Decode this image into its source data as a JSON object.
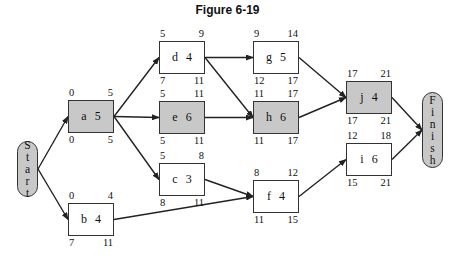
{
  "title": "Figure 6-19",
  "start": {
    "label": [
      "S",
      "t",
      "a",
      "r",
      "t"
    ]
  },
  "finish": {
    "label": [
      "F",
      "i",
      "n",
      "i",
      "s",
      "h"
    ]
  },
  "colors": {
    "critical": "#c8c8c8",
    "normal": "#ffffff",
    "line": "#222222"
  },
  "nodes": [
    {
      "id": "a",
      "dur": "5",
      "es": "0",
      "ef": "5",
      "ls": "0",
      "lf": "5",
      "critical": true,
      "x": 68,
      "y": 100
    },
    {
      "id": "b",
      "dur": "4",
      "es": "0",
      "ef": "4",
      "ls": "7",
      "lf": "11",
      "critical": false,
      "x": 68,
      "y": 203
    },
    {
      "id": "d",
      "dur": "4",
      "es": "5",
      "ef": "9",
      "ls": "7",
      "lf": "11",
      "critical": false,
      "x": 159,
      "y": 41
    },
    {
      "id": "e",
      "dur": "6",
      "es": "5",
      "ef": "11",
      "ls": "5",
      "lf": "11",
      "critical": true,
      "x": 159,
      "y": 101
    },
    {
      "id": "c",
      "dur": "3",
      "es": "5",
      "ef": "8",
      "ls": "8",
      "lf": "11",
      "critical": false,
      "x": 159,
      "y": 163
    },
    {
      "id": "g",
      "dur": "5",
      "es": "9",
      "ef": "14",
      "ls": "12",
      "lf": "17",
      "critical": false,
      "x": 253,
      "y": 41
    },
    {
      "id": "h",
      "dur": "6",
      "es": "11",
      "ef": "17",
      "ls": "11",
      "lf": "17",
      "critical": true,
      "x": 253,
      "y": 101
    },
    {
      "id": "f",
      "dur": "4",
      "es": "8",
      "ef": "12",
      "ls": "11",
      "lf": "15",
      "critical": false,
      "x": 253,
      "y": 180
    },
    {
      "id": "j",
      "dur": "4",
      "es": "17",
      "ef": "21",
      "ls": "17",
      "lf": "21",
      "critical": true,
      "x": 346,
      "y": 81
    },
    {
      "id": "i",
      "dur": "6",
      "es": "12",
      "ef": "18",
      "ls": "15",
      "lf": "21",
      "critical": false,
      "x": 346,
      "y": 143
    }
  ],
  "edges": [
    [
      "Start",
      "a"
    ],
    [
      "Start",
      "b"
    ],
    [
      "a",
      "d"
    ],
    [
      "a",
      "e"
    ],
    [
      "a",
      "c"
    ],
    [
      "d",
      "g"
    ],
    [
      "d",
      "h"
    ],
    [
      "e",
      "h"
    ],
    [
      "c",
      "f"
    ],
    [
      "b",
      "f"
    ],
    [
      "g",
      "j"
    ],
    [
      "h",
      "j"
    ],
    [
      "f",
      "i"
    ],
    [
      "j",
      "Finish"
    ],
    [
      "i",
      "Finish"
    ]
  ]
}
